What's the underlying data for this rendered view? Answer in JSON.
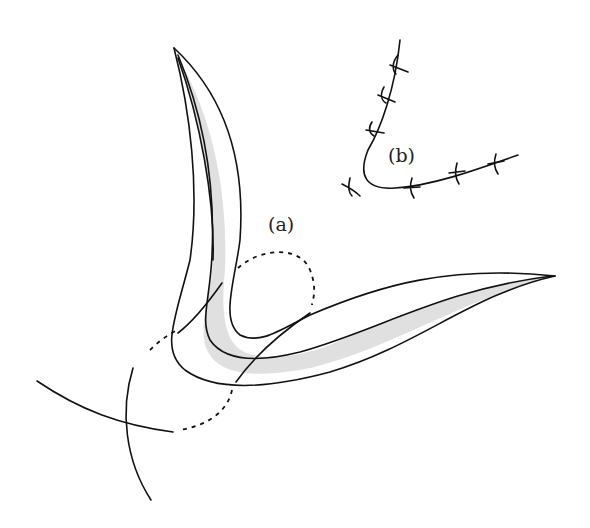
{
  "diagram": {
    "labels": {
      "a": "(a)",
      "b": "(b)"
    },
    "colors": {
      "line": "#111111",
      "fill": "#e0e0e0",
      "background": "#ffffff"
    },
    "elements": [
      "crescent/boomerang shape with shaded band (outer and inner outlines)",
      "dashed circle region labeled (a) at bend",
      "two crossing arcs at lower left",
      "curve with cross-hatch marks labeled (b) at upper right"
    ]
  }
}
